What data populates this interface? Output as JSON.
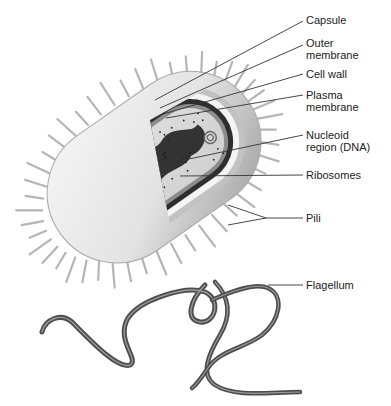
{
  "diagram": {
    "cutoff_top_text": "by ing g g g g g g g g g g g g g g g g g g g g g",
    "labels": [
      {
        "id": "capsule",
        "text": "Capsule"
      },
      {
        "id": "outer-membrane",
        "text": "Outer\nmembrane"
      },
      {
        "id": "cell-wall",
        "text": "Cell wall"
      },
      {
        "id": "plasma-membrane",
        "text": "Plasma\nmembrane"
      },
      {
        "id": "nucleoid",
        "text": "Nucleoid\nregion (DNA)"
      },
      {
        "id": "ribosomes",
        "text": "Ribosomes"
      },
      {
        "id": "pili",
        "text": "Pili"
      },
      {
        "id": "flagellum",
        "text": "Flagellum"
      }
    ],
    "colors": {
      "capsule": "#e6e6e6",
      "outer_membrane": "#bdbdbd",
      "cell_wall": "#2b2b2b",
      "plasma_membrane": "#8a8a8a",
      "cytoplasm": "#d8d8d8",
      "nucleoid": "#333333",
      "flagellum": "#555555",
      "leader": "#333333"
    }
  }
}
